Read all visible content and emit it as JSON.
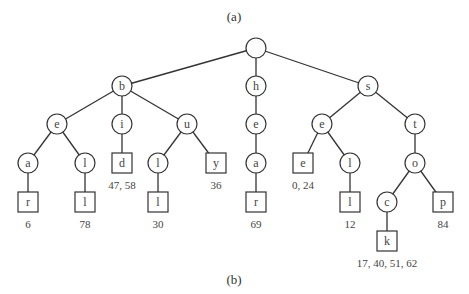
{
  "captions": {
    "top": "(a)",
    "bottom": "(b)"
  },
  "nodes": [
    {
      "id": "root",
      "label": "",
      "shape": "circle",
      "x": 256,
      "y": 48
    },
    {
      "id": "b",
      "label": "b",
      "shape": "circle",
      "x": 122,
      "y": 86
    },
    {
      "id": "h",
      "label": "h",
      "shape": "circle",
      "x": 256,
      "y": 86
    },
    {
      "id": "s",
      "label": "s",
      "shape": "circle",
      "x": 368,
      "y": 86
    },
    {
      "id": "be",
      "label": "e",
      "shape": "circle",
      "x": 57,
      "y": 124
    },
    {
      "id": "bi",
      "label": "i",
      "shape": "circle",
      "x": 122,
      "y": 124
    },
    {
      "id": "bu",
      "label": "u",
      "shape": "circle",
      "x": 187,
      "y": 124
    },
    {
      "id": "he",
      "label": "e",
      "shape": "circle",
      "x": 256,
      "y": 124
    },
    {
      "id": "se",
      "label": "e",
      "shape": "circle",
      "x": 322,
      "y": 124
    },
    {
      "id": "st",
      "label": "t",
      "shape": "circle",
      "x": 415,
      "y": 124
    },
    {
      "id": "bea",
      "label": "a",
      "shape": "circle",
      "x": 28,
      "y": 163
    },
    {
      "id": "bel",
      "label": "l",
      "shape": "circle",
      "x": 85,
      "y": 163
    },
    {
      "id": "bid",
      "label": "d",
      "shape": "box",
      "x": 122,
      "y": 163,
      "value": "47, 58"
    },
    {
      "id": "bul",
      "label": "l",
      "shape": "circle",
      "x": 158,
      "y": 163
    },
    {
      "id": "buy",
      "label": "y",
      "shape": "box",
      "x": 216,
      "y": 163,
      "value": "36"
    },
    {
      "id": "hea",
      "label": "a",
      "shape": "circle",
      "x": 256,
      "y": 163
    },
    {
      "id": "see",
      "label": "e",
      "shape": "box",
      "x": 303,
      "y": 163,
      "value": "0, 24"
    },
    {
      "id": "sel",
      "label": "l",
      "shape": "circle",
      "x": 350,
      "y": 163
    },
    {
      "id": "sto",
      "label": "o",
      "shape": "circle",
      "x": 415,
      "y": 163
    },
    {
      "id": "bear",
      "label": "r",
      "shape": "box",
      "x": 28,
      "y": 202,
      "value": "6"
    },
    {
      "id": "bell",
      "label": "l",
      "shape": "box",
      "x": 85,
      "y": 202,
      "value": "78"
    },
    {
      "id": "bull",
      "label": "l",
      "shape": "box",
      "x": 158,
      "y": 202,
      "value": "30"
    },
    {
      "id": "hear",
      "label": "r",
      "shape": "box",
      "x": 256,
      "y": 202,
      "value": "69"
    },
    {
      "id": "sell",
      "label": "l",
      "shape": "box",
      "x": 350,
      "y": 202,
      "value": "12"
    },
    {
      "id": "stoc",
      "label": "c",
      "shape": "circle",
      "x": 387,
      "y": 202
    },
    {
      "id": "stop",
      "label": "p",
      "shape": "box",
      "x": 443,
      "y": 202,
      "value": "84"
    },
    {
      "id": "stock",
      "label": "k",
      "shape": "box",
      "x": 387,
      "y": 241,
      "value": "17, 40, 51, 62"
    }
  ],
  "edges": [
    [
      "root",
      "b"
    ],
    [
      "root",
      "h"
    ],
    [
      "root",
      "s"
    ],
    [
      "b",
      "be"
    ],
    [
      "b",
      "bi"
    ],
    [
      "b",
      "bu"
    ],
    [
      "h",
      "he"
    ],
    [
      "s",
      "se"
    ],
    [
      "s",
      "st"
    ],
    [
      "be",
      "bea"
    ],
    [
      "be",
      "bel"
    ],
    [
      "bi",
      "bid"
    ],
    [
      "bu",
      "bul"
    ],
    [
      "bu",
      "buy"
    ],
    [
      "he",
      "hea"
    ],
    [
      "se",
      "see"
    ],
    [
      "se",
      "sel"
    ],
    [
      "st",
      "sto"
    ],
    [
      "bea",
      "bear"
    ],
    [
      "bel",
      "bell"
    ],
    [
      "bul",
      "bull"
    ],
    [
      "hea",
      "hear"
    ],
    [
      "sel",
      "sell"
    ],
    [
      "sto",
      "stoc"
    ],
    [
      "sto",
      "stop"
    ],
    [
      "stoc",
      "stock"
    ]
  ]
}
